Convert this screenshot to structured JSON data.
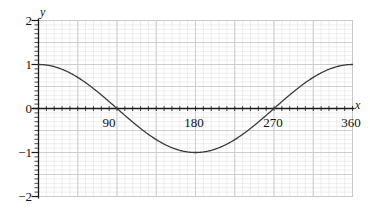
{
  "chart_data": {
    "type": "line",
    "title": "",
    "xlabel": "x",
    "ylabel": "y",
    "function": "y = cos(x)",
    "xlim": [
      0,
      360
    ],
    "ylim": [
      -2,
      2
    ],
    "grid": true,
    "minor_grid": true,
    "legend": "none",
    "x_ticks": [
      90,
      180,
      270,
      360
    ],
    "x_tick_labels": [
      "90",
      "180",
      "270",
      "360"
    ],
    "y_ticks": [
      2,
      1,
      0,
      -1,
      -2
    ],
    "y_tick_labels": [
      "2",
      "1",
      "0",
      "−1",
      "−2"
    ],
    "x": [
      0,
      10,
      20,
      30,
      40,
      50,
      60,
      70,
      80,
      90,
      100,
      110,
      120,
      130,
      140,
      150,
      160,
      170,
      180,
      190,
      200,
      210,
      220,
      230,
      240,
      250,
      260,
      270,
      280,
      290,
      300,
      310,
      320,
      330,
      340,
      350,
      360
    ],
    "values": [
      1.0,
      0.985,
      0.94,
      0.866,
      0.766,
      0.643,
      0.5,
      0.342,
      0.174,
      0.0,
      -0.174,
      -0.342,
      -0.5,
      -0.643,
      -0.766,
      -0.866,
      -0.94,
      -0.985,
      -1.0,
      -0.985,
      -0.94,
      -0.866,
      -0.766,
      -0.643,
      -0.5,
      -0.342,
      -0.174,
      0.0,
      0.174,
      0.342,
      0.5,
      0.643,
      0.766,
      0.866,
      0.94,
      0.985,
      1.0
    ],
    "curve_color": "#3a3a3a",
    "grid_color": "#c9c9c9",
    "minor_grid_color": "#e2e2e2",
    "axis_color": "#1a1a1a"
  },
  "axis_labels": {
    "x_name": "x",
    "y_name": "y"
  }
}
